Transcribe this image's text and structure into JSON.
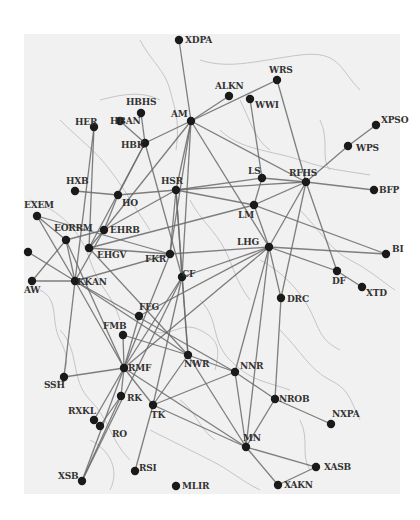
{
  "diagram": {
    "type": "network-map",
    "background_color": "#f1f1f1",
    "node_color": "#1a1a1a",
    "edge_color": "#6a6a6a",
    "nodes": [
      {
        "id": "XDPA",
        "x": 179,
        "y": 40,
        "lx": 6,
        "ly": 3
      },
      {
        "id": "AM",
        "x": 191,
        "y": 121,
        "lx": -20,
        "ly": -4
      },
      {
        "id": "ALKN",
        "x": 229,
        "y": 96,
        "lx": -14,
        "ly": -7
      },
      {
        "id": "WWI",
        "x": 250,
        "y": 99,
        "lx": 5,
        "ly": 9
      },
      {
        "id": "WRS",
        "x": 277,
        "y": 80,
        "lx": -8,
        "ly": -7
      },
      {
        "id": "HBHS",
        "x": 141,
        "y": 113,
        "lx": -15,
        "ly": -8
      },
      {
        "id": "HBAN",
        "x": 120,
        "y": 121,
        "lx": -10,
        "ly": 3
      },
      {
        "id": "HER",
        "x": 94,
        "y": 127,
        "lx": -19,
        "ly": -2
      },
      {
        "id": "HBK",
        "x": 145,
        "y": 143,
        "lx": -24,
        "ly": 5
      },
      {
        "id": "XPSO",
        "x": 376,
        "y": 125,
        "lx": 5,
        "ly": -2
      },
      {
        "id": "WPS",
        "x": 348,
        "y": 146,
        "lx": 8,
        "ly": 5
      },
      {
        "id": "RFHS",
        "x": 306,
        "y": 182,
        "lx": -17,
        "ly": -6
      },
      {
        "id": "LS",
        "x": 262,
        "y": 178,
        "lx": -14,
        "ly": -4
      },
      {
        "id": "BFP",
        "x": 374,
        "y": 190,
        "lx": 5,
        "ly": 3
      },
      {
        "id": "HXB",
        "x": 75,
        "y": 191,
        "lx": -9,
        "ly": -7
      },
      {
        "id": "HO",
        "x": 118,
        "y": 195,
        "lx": 4,
        "ly": 11
      },
      {
        "id": "HSR",
        "x": 176,
        "y": 190,
        "lx": -15,
        "ly": -6
      },
      {
        "id": "LM",
        "x": 254,
        "y": 205,
        "lx": -16,
        "ly": 13
      },
      {
        "id": "EXEM",
        "x": 37,
        "y": 216,
        "lx": -13,
        "ly": -8
      },
      {
        "id": "EORRM",
        "x": 66,
        "y": 240,
        "lx": -12,
        "ly": -9
      },
      {
        "id": "EHRB",
        "x": 104,
        "y": 230,
        "lx": 6,
        "ly": 3
      },
      {
        "id": "EHGV",
        "x": 89,
        "y": 248,
        "lx": 8,
        "ly": 10
      },
      {
        "id": "FKR",
        "x": 170,
        "y": 254,
        "lx": -25,
        "ly": 8
      },
      {
        "id": "LHG",
        "x": 269,
        "y": 247,
        "lx": -32,
        "ly": -2
      },
      {
        "id": "BI",
        "x": 386,
        "y": 254,
        "lx": 6,
        "ly": -2
      },
      {
        "id": "DF",
        "x": 337,
        "y": 271,
        "lx": -5,
        "ly": 13
      },
      {
        "id": "XTD",
        "x": 362,
        "y": 287,
        "lx": 4,
        "ly": 9
      },
      {
        "id": "DRC",
        "x": 281,
        "y": 298,
        "lx": 6,
        "ly": 4
      },
      {
        "id": "",
        "x": 28,
        "y": 252,
        "lx": 0,
        "ly": 0
      },
      {
        "id": "AW",
        "x": 32,
        "y": 281,
        "lx": -8,
        "ly": 12
      },
      {
        "id": "KKAN",
        "x": 75,
        "y": 281,
        "lx": 2,
        "ly": 4
      },
      {
        "id": "CF",
        "x": 182,
        "y": 277,
        "lx": 0,
        "ly": 0
      },
      {
        "id": "FFG",
        "x": 139,
        "y": 316,
        "lx": 0,
        "ly": -6
      },
      {
        "id": "FMB",
        "x": 123,
        "y": 335,
        "lx": -20,
        "ly": -6
      },
      {
        "id": "RMF",
        "x": 124,
        "y": 368,
        "lx": 4,
        "ly": 3
      },
      {
        "id": "NWR",
        "x": 188,
        "y": 355,
        "lx": -4,
        "ly": 12
      },
      {
        "id": "NNR",
        "x": 235,
        "y": 372,
        "lx": 5,
        "ly": -3
      },
      {
        "id": "SSH",
        "x": 64,
        "y": 377,
        "lx": -20,
        "ly": 11
      },
      {
        "id": "RK",
        "x": 121,
        "y": 396,
        "lx": 6,
        "ly": 5
      },
      {
        "id": "TK",
        "x": 153,
        "y": 405,
        "lx": -2,
        "ly": 13
      },
      {
        "id": "RXKL",
        "x": 94,
        "y": 420,
        "lx": -26,
        "ly": -6
      },
      {
        "id": "RO",
        "x": 100,
        "y": 426,
        "lx": 12,
        "ly": 11
      },
      {
        "id": "NROB",
        "x": 275,
        "y": 399,
        "lx": 4,
        "ly": 3
      },
      {
        "id": "NXPA",
        "x": 331,
        "y": 424,
        "lx": 1,
        "ly": -7
      },
      {
        "id": "MN",
        "x": 246,
        "y": 447,
        "lx": -3,
        "ly": -6
      },
      {
        "id": "XASB",
        "x": 316,
        "y": 467,
        "lx": 8,
        "ly": 3
      },
      {
        "id": "XAKN",
        "x": 278,
        "y": 485,
        "lx": 6,
        "ly": 3
      },
      {
        "id": "XSB",
        "x": 82,
        "y": 481,
        "lx": -24,
        "ly": -2
      },
      {
        "id": "RSI",
        "x": 135,
        "y": 471,
        "lx": 4,
        "ly": 0
      },
      {
        "id": "MLIR",
        "x": 176,
        "y": 486,
        "lx": 6,
        "ly": 3
      }
    ],
    "edges": [
      [
        "XDPA",
        "AM"
      ],
      [
        "AM",
        "WRS"
      ],
      [
        "AM",
        "ALKN"
      ],
      [
        "AM",
        "HBK"
      ],
      [
        "AM",
        "RFHS"
      ],
      [
        "AM",
        "HSR"
      ],
      [
        "AM",
        "LHG"
      ],
      [
        "AM",
        "EHRB"
      ],
      [
        "AM",
        "FKR"
      ],
      [
        "AM",
        "CF"
      ],
      [
        "WRS",
        "RFHS"
      ],
      [
        "WWI",
        "LS"
      ],
      [
        "HBHS",
        "HBK"
      ],
      [
        "HBAN",
        "HBK"
      ],
      [
        "HBK",
        "HO"
      ],
      [
        "HBK",
        "CF"
      ],
      [
        "HBK",
        "EHGV"
      ],
      [
        "HER",
        "EHGV"
      ],
      [
        "HER",
        "KKAN"
      ],
      [
        "XPSO",
        "WPS"
      ],
      [
        "WPS",
        "RFHS"
      ],
      [
        "RFHS",
        "LS"
      ],
      [
        "RFHS",
        "BFP"
      ],
      [
        "RFHS",
        "LM"
      ],
      [
        "RFHS",
        "DF"
      ],
      [
        "RFHS",
        "DRC"
      ],
      [
        "RFHS",
        "LHG"
      ],
      [
        "RFHS",
        "HSR"
      ],
      [
        "HXB",
        "HO"
      ],
      [
        "HO",
        "EHRB"
      ],
      [
        "HO",
        "HSR"
      ],
      [
        "HSR",
        "LS"
      ],
      [
        "HSR",
        "LM"
      ],
      [
        "HSR",
        "EHRB"
      ],
      [
        "HSR",
        "FKR"
      ],
      [
        "HSR",
        "CF"
      ],
      [
        "HSR",
        "NWR"
      ],
      [
        "LS",
        "LM"
      ],
      [
        "LM",
        "LHG"
      ],
      [
        "LM",
        "BI"
      ],
      [
        "LM",
        "EHGV"
      ],
      [
        "EXEM",
        "EORRM"
      ],
      [
        "EXEM",
        "KKAN"
      ],
      [
        "EXEM",
        "FKR"
      ],
      [
        "EORRM",
        "KKAN"
      ],
      [
        "EORRM",
        "EHRB"
      ],
      [
        "EORRM",
        "RMF"
      ],
      [
        "EHRB",
        "EHGV"
      ],
      [
        "EHRB",
        "KKAN"
      ],
      [
        "EHGV",
        "FKR"
      ],
      [
        "EHGV",
        "NWR"
      ],
      [
        "FKR",
        "LHG"
      ],
      [
        "FKR",
        "KKAN"
      ],
      [
        "FKR",
        "RMF"
      ],
      [
        "LHG",
        "BI"
      ],
      [
        "LHG",
        "DF"
      ],
      [
        "LHG",
        "DRC"
      ],
      [
        "LHG",
        "CF"
      ],
      [
        "LHG",
        "NNR"
      ],
      [
        "LHG",
        "RMF"
      ],
      [
        "LHG",
        "MN"
      ],
      [
        "DF",
        "XTD"
      ],
      [
        "",
        "KKAN"
      ],
      [
        "AW",
        "KKAN"
      ],
      [
        "AW",
        "EORRM"
      ],
      [
        "KKAN",
        "SSH"
      ],
      [
        "KKAN",
        "NWR"
      ],
      [
        "KKAN",
        "RMF"
      ],
      [
        "KKAN",
        "NNR"
      ],
      [
        "CF",
        "RMF"
      ],
      [
        "CF",
        "NWR"
      ],
      [
        "CF",
        "TK"
      ],
      [
        "CF",
        "XSB"
      ],
      [
        "FFG",
        "RMF"
      ],
      [
        "FFG",
        "LHG"
      ],
      [
        "FMB",
        "RMF"
      ],
      [
        "FMB",
        "NWR"
      ],
      [
        "RMF",
        "SSH"
      ],
      [
        "RMF",
        "RK"
      ],
      [
        "RMF",
        "TK"
      ],
      [
        "RMF",
        "RXKL"
      ],
      [
        "RMF",
        "XSB"
      ],
      [
        "RMF",
        "MN"
      ],
      [
        "NWR",
        "NNR"
      ],
      [
        "NWR",
        "TK"
      ],
      [
        "NWR",
        "MN"
      ],
      [
        "NNR",
        "NROB"
      ],
      [
        "NNR",
        "MN"
      ],
      [
        "NNR",
        "TK"
      ],
      [
        "DRC",
        "NROB"
      ],
      [
        "NROB",
        "NXPA"
      ],
      [
        "NROB",
        "MN"
      ],
      [
        "RK",
        "RO"
      ],
      [
        "RK",
        "XSB"
      ],
      [
        "TK",
        "RSI"
      ],
      [
        "TK",
        "MN"
      ],
      [
        "MN",
        "XASB"
      ],
      [
        "MN",
        "XAKN"
      ],
      [
        "XASB",
        "XAKN"
      ]
    ]
  }
}
